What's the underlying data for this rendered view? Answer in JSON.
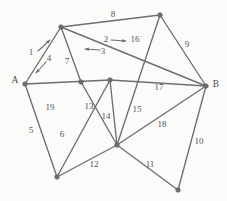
{
  "diagram": {
    "background_color": "#fbfbf9",
    "line_color": "#6e6e6e",
    "label_color": "#55555a",
    "width": 227,
    "height": 201,
    "nodes": [
      {
        "id": "n_top_left",
        "label": "",
        "x": 61,
        "y": 27,
        "label_x": 61,
        "label_y": 27
      },
      {
        "id": "n_top_right",
        "label": "",
        "x": 160,
        "y": 15,
        "label_x": 160,
        "label_y": 15
      },
      {
        "id": "n_a",
        "label": "A",
        "x": 25,
        "y": 84,
        "label_x": 15,
        "label_y": 81
      },
      {
        "id": "n_b",
        "label": "B",
        "x": 206,
        "y": 86,
        "label_x": 216,
        "label_y": 85
      },
      {
        "id": "n_mid_left",
        "label": "",
        "x": 81,
        "y": 82,
        "label_x": 81,
        "label_y": 82
      },
      {
        "id": "n_center",
        "label": "",
        "x": 110,
        "y": 80,
        "label_x": 110,
        "label_y": 80
      },
      {
        "id": "n_bottom_left",
        "label": "",
        "x": 57,
        "y": 177,
        "label_x": 57,
        "label_y": 177
      },
      {
        "id": "n_bottom_center",
        "label": "",
        "x": 117,
        "y": 145,
        "label_x": 117,
        "label_y": 145
      },
      {
        "id": "n_bottom_right",
        "label": "",
        "x": 178,
        "y": 190,
        "label_x": 178,
        "label_y": 190
      }
    ],
    "edges": [
      {
        "id": "e1",
        "label": "1",
        "from": "n_a",
        "to": "n_top_left",
        "label_x": 31,
        "label_y": 53
      },
      {
        "id": "e4",
        "label": "4",
        "from": "n_a",
        "to": "n_top_left",
        "label_x": 49,
        "label_y": 59
      },
      {
        "id": "e2",
        "label": "2",
        "from": "n_top_left",
        "to": "n_b",
        "label_x": 106,
        "label_y": 40
      },
      {
        "id": "e3",
        "label": "3",
        "from": "n_top_left",
        "to": "n_b",
        "label_x": 103,
        "label_y": 52
      },
      {
        "id": "e7",
        "label": "7",
        "from": "n_top_left",
        "to": "n_mid_left",
        "label_x": 67,
        "label_y": 62
      },
      {
        "id": "e8",
        "label": "8",
        "from": "n_top_left",
        "to": "n_top_right",
        "label_x": 113,
        "label_y": 15
      },
      {
        "id": "e9",
        "label": "9",
        "from": "n_top_right",
        "to": "n_b",
        "label_x": 187,
        "label_y": 45
      },
      {
        "id": "e16",
        "label": "16",
        "from": "n_top_right",
        "to": "n_bottom_center",
        "label_x": 135,
        "label_y": 40
      },
      {
        "id": "e17",
        "label": "17",
        "from": "n_center",
        "to": "n_b",
        "label_x": 159,
        "label_y": 88
      },
      {
        "id": "e5",
        "label": "5",
        "from": "n_a",
        "to": "n_bottom_left",
        "label_x": 31,
        "label_y": 131
      },
      {
        "id": "e19",
        "label": "19",
        "from": "n_a",
        "to": "n_center",
        "label_x": 50,
        "label_y": 108
      },
      {
        "id": "e6",
        "label": "6",
        "from": "n_bottom_left",
        "to": "n_center",
        "label_x": 62,
        "label_y": 135
      },
      {
        "id": "e13",
        "label": "13",
        "from": "n_mid_left",
        "to": "n_bottom_center",
        "label_x": 89,
        "label_y": 107
      },
      {
        "id": "e14",
        "label": "14",
        "from": "n_center",
        "to": "n_bottom_center",
        "label_x": 106,
        "label_y": 117
      },
      {
        "id": "e15",
        "label": "15",
        "from": "n_bottom_center",
        "to": "n_top_right",
        "label_x": 137,
        "label_y": 110
      },
      {
        "id": "e12",
        "label": "12",
        "from": "n_bottom_left",
        "to": "n_bottom_center",
        "label_x": 94,
        "label_y": 165
      },
      {
        "id": "e18",
        "label": "18",
        "from": "n_bottom_center",
        "to": "n_b",
        "label_x": 162,
        "label_y": 125
      },
      {
        "id": "e11",
        "label": "11",
        "from": "n_bottom_center",
        "to": "n_bottom_right",
        "label_x": 150,
        "label_y": 165
      },
      {
        "id": "e10",
        "label": "10",
        "from": "n_b",
        "to": "n_bottom_right",
        "label_x": 199,
        "label_y": 142
      }
    ],
    "arrows": [
      {
        "id": "arrow_1",
        "for_edge": "1",
        "direction": "up-right",
        "x1": 38,
        "y1": 51,
        "x2": 50,
        "y2": 40
      },
      {
        "id": "arrow_4",
        "for_edge": "4",
        "direction": "down-left",
        "x1": 46,
        "y1": 62,
        "x2": 36,
        "y2": 73
      },
      {
        "id": "arrow_2",
        "for_edge": "2",
        "direction": "right",
        "x1": 111,
        "y1": 40,
        "x2": 126,
        "y2": 41
      },
      {
        "id": "arrow_3",
        "for_edge": "3",
        "direction": "left",
        "x1": 100,
        "y1": 50,
        "x2": 85,
        "y2": 49
      }
    ]
  }
}
